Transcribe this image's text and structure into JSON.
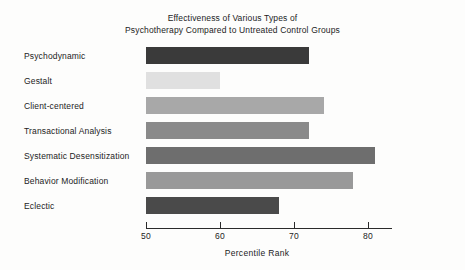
{
  "chart_data": {
    "type": "bar",
    "orientation": "horizontal",
    "title": "Effectiveness of Various Types of Psychotherapy Compared to Untreated Control Groups",
    "title_lines": [
      "Effectiveness of Various Types of",
      "Psychotherapy Compared to Untreated Control Groups"
    ],
    "categories": [
      "Psychodynamic",
      "Gestalt",
      "Client-centered",
      "Transactional Analysis",
      "Systematic Desensitization",
      "Behavior Modification",
      "Eclectic"
    ],
    "values": [
      72,
      60,
      74,
      72,
      81,
      78,
      68
    ],
    "bar_colors": [
      "#3a3a3a",
      "#e0e0e0",
      "#a8a8a8",
      "#8a8a8a",
      "#6e6e6e",
      "#999999",
      "#4a4a4a"
    ],
    "xlabel": "Percentile Rank",
    "ylabel": "",
    "xlim": [
      50,
      83.2
    ],
    "xticks": [
      50,
      60,
      70,
      80
    ],
    "xtick_labels": [
      "50",
      "60",
      "70",
      "80"
    ],
    "grid": false,
    "legend": "none",
    "axis_color": "#2a2a2a"
  }
}
